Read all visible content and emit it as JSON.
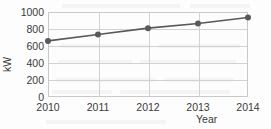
{
  "chart_data": {
    "type": "line",
    "title": "",
    "xlabel": "Year",
    "ylabel": "kW",
    "categories": [
      "2010",
      "2011",
      "2012",
      "2013",
      "2014"
    ],
    "x": [
      2010,
      2011,
      2012,
      2013,
      2014
    ],
    "values": [
      660,
      735,
      810,
      865,
      935
    ],
    "series": [
      {
        "name": "kW",
        "values": [
          660,
          735,
          810,
          865,
          935
        ]
      }
    ],
    "ylim": [
      0,
      1000
    ],
    "ytick_labels": [
      "0",
      "200",
      "400",
      "600",
      "800",
      "1000"
    ],
    "ytick_values": [
      0,
      200,
      400,
      600,
      800,
      1000
    ],
    "xtick_labels": [
      "2010",
      "2011",
      "2012",
      "2013",
      "2014"
    ],
    "grid": true,
    "legend": false,
    "legend_position": "none",
    "marker": "circle",
    "colors": {
      "series_line": "#595959",
      "marker": "#595959",
      "gridline": "#d2d2d2",
      "axis_border": "#c9c9c9",
      "tick_label": "#3a3a3a",
      "background": "#fdfdfd"
    }
  },
  "axis": {
    "y_title": "kW",
    "x_title": "Year"
  }
}
